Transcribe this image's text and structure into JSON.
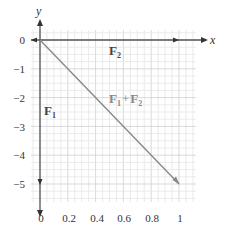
{
  "axes": {
    "x_label": "x",
    "y_label": "y",
    "x_ticks": [
      "0",
      "0.2",
      "0.4",
      "0.6",
      "0.8",
      "1"
    ],
    "y_ticks": [
      "0",
      "−1",
      "−2",
      "−3",
      "−4",
      "−5"
    ]
  },
  "vectors": {
    "f1": {
      "label": "F",
      "sub": "1",
      "components": [
        0,
        -5
      ]
    },
    "f2": {
      "label": "F",
      "sub": "2",
      "components": [
        1,
        0
      ]
    },
    "sum": {
      "label_a": "F",
      "sub_a": "1",
      "plus": "+",
      "label_b": "F",
      "sub_b": "2",
      "components": [
        1,
        -5
      ]
    }
  },
  "colors": {
    "axis": "#555555",
    "sum_vector": "#888888",
    "grid_minor": "#e6e6e6",
    "grid_major": "#cfcfcf"
  }
}
